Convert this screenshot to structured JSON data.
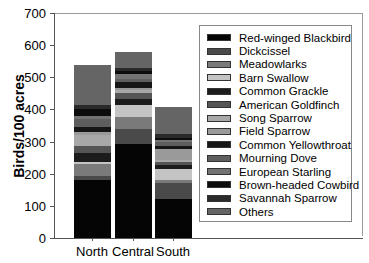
{
  "chart_data": {
    "type": "bar",
    "stacked": true,
    "title": "",
    "xlabel": "",
    "ylabel": "Birds/100 acres",
    "ylim": [
      0,
      700
    ],
    "yticks": [
      0,
      100,
      200,
      300,
      400,
      500,
      600,
      700
    ],
    "grid": false,
    "legend_position": "right-inside",
    "categories": [
      "North",
      "Central",
      "South"
    ],
    "series": [
      {
        "name": "Red-winged Blackbird",
        "color": "#050505",
        "values": [
          180,
          293,
          121
        ]
      },
      {
        "name": "Dickcissel",
        "color": "#4a4a4a",
        "values": [
          12,
          45,
          50
        ]
      },
      {
        "name": "Meadowlarks",
        "color": "#7a7a7a",
        "values": [
          37,
          40,
          10
        ]
      },
      {
        "name": "Barn Swallow",
        "color": "#c4c4c4",
        "values": [
          9,
          35,
          35
        ]
      },
      {
        "name": "Common Grackle",
        "color": "#1c1c1c",
        "values": [
          28,
          20,
          12
        ]
      },
      {
        "name": "American Goldfinch",
        "color": "#555555",
        "values": [
          20,
          18,
          10
        ]
      },
      {
        "name": "Song Sparrow",
        "color": "#a8a8a8",
        "values": [
          35,
          10,
          5
        ]
      },
      {
        "name": "Field Sparrow",
        "color": "#9a9a9a",
        "values": [
          8,
          5,
          35
        ]
      },
      {
        "name": "Common Yellowthroat",
        "color": "#161616",
        "values": [
          18,
          20,
          10
        ]
      },
      {
        "name": "Mourning Dove",
        "color": "#5e5e5e",
        "values": [
          22,
          10,
          12
        ]
      },
      {
        "name": "European Starling",
        "color": "#737373",
        "values": [
          12,
          15,
          5
        ]
      },
      {
        "name": "Brown-headed Cowbird",
        "color": "#0c0c0c",
        "values": [
          20,
          8,
          8
        ]
      },
      {
        "name": "Savannah Sparrow",
        "color": "#2a2a2a",
        "values": [
          13,
          10,
          10
        ]
      },
      {
        "name": "Others",
        "color": "#656565",
        "values": [
          125,
          50,
          85
        ]
      }
    ],
    "totals": [
      539,
      579,
      408
    ]
  },
  "axis": {
    "ytitle": "Birds/100 acres",
    "yticks": [
      "0",
      "100",
      "200",
      "300",
      "400",
      "500",
      "600",
      "700"
    ],
    "xticks": [
      "North",
      "Central",
      "South"
    ]
  }
}
